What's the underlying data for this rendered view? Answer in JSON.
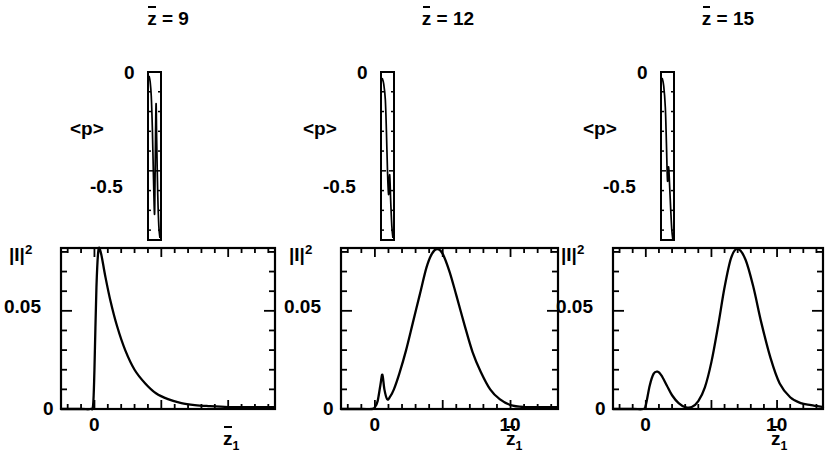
{
  "figure": {
    "type": "multi-panel scientific line plot",
    "n_columns": 3
  },
  "columns": [
    {
      "title": "z̅ = 9",
      "title_symbol": "z",
      "title_value": "9",
      "upper": {
        "ylabel": "<p>",
        "yticks": [
          "0",
          "-0.5"
        ],
        "ylim": [
          -0.85,
          0.0
        ],
        "xlim": [
          -0.6,
          0.6
        ]
      },
      "lower": {
        "ylabel": "|I|",
        "ylabel_exponent": "2",
        "yticks": [
          "0.05",
          "0"
        ],
        "xticks": [
          "0"
        ],
        "xlabel": "z̅1",
        "xlabel_base": "z",
        "xlabel_sub": "1",
        "ylim": [
          0,
          0.082
        ],
        "xlim": [
          -2.5,
          13.5
        ]
      }
    },
    {
      "title": "z̅ = 12",
      "title_symbol": "z",
      "title_value": "12",
      "upper": {
        "ylabel": "<p>",
        "yticks": [
          "0",
          "-0.5"
        ],
        "ylim": [
          -0.85,
          0.0
        ],
        "xlim": [
          -0.6,
          0.6
        ]
      },
      "lower": {
        "ylabel": "|I|",
        "ylabel_exponent": "2",
        "yticks": [
          "0.05",
          "0"
        ],
        "xticks": [
          "0",
          "10"
        ],
        "xlabel": "z̅1",
        "xlabel_base": "z",
        "xlabel_sub": "1",
        "ylim": [
          0,
          0.082
        ],
        "xlim": [
          -2.5,
          13.5
        ]
      }
    },
    {
      "title": "z̅ = 15",
      "title_symbol": "z",
      "title_value": "15",
      "upper": {
        "ylabel": "<p>",
        "yticks": [
          "0",
          "-0.5"
        ],
        "ylim": [
          -0.85,
          0.0
        ],
        "xlim": [
          -0.6,
          0.6
        ]
      },
      "lower": {
        "ylabel": "|I|",
        "ylabel_exponent": "2",
        "yticks": [
          "0.05",
          "0"
        ],
        "xticks": [
          "0",
          "10"
        ],
        "xlabel": "z̅1",
        "xlabel_base": "z",
        "xlabel_sub": "1",
        "ylim": [
          0,
          0.082
        ],
        "xlim": [
          -2.5,
          13.5
        ]
      }
    }
  ],
  "chart_data": [
    {
      "type": "line",
      "panel": "upper-1",
      "title": "z̅ = 9",
      "xlabel": "",
      "ylabel": "<p>",
      "xlim": [
        -0.6,
        0.6
      ],
      "ylim": [
        -0.85,
        0.0
      ],
      "yticks": [
        0,
        -0.5
      ],
      "grid": false,
      "legend": "none",
      "x": [
        -0.5,
        -0.4,
        -0.3,
        -0.2,
        -0.1,
        0.0,
        0.05,
        0.1,
        0.15,
        0.2,
        0.3,
        0.4,
        0.5
      ],
      "y": [
        -0.02,
        -0.05,
        -0.12,
        -0.28,
        -0.52,
        -0.72,
        -0.55,
        -0.3,
        -0.16,
        -0.34,
        -0.62,
        -0.78,
        -0.84
      ]
    },
    {
      "type": "line",
      "panel": "lower-1",
      "title": "",
      "xlabel": "z̅1",
      "ylabel": "|I|²",
      "xlim": [
        -2.5,
        13.5
      ],
      "ylim": [
        0,
        0.082
      ],
      "xticks": [
        0
      ],
      "yticks": [
        0,
        0.05
      ],
      "grid": false,
      "legend": "none",
      "x": [
        -2.5,
        -1.0,
        -0.3,
        -0.1,
        0.0,
        0.15,
        0.3,
        0.5,
        0.8,
        1.2,
        1.7,
        2.3,
        3.0,
        3.8,
        4.6,
        5.5,
        6.5,
        7.5,
        8.5,
        10.0,
        11.5,
        13.5
      ],
      "y": [
        0.0,
        0.0,
        0.0,
        0.002,
        0.02,
        0.062,
        0.081,
        0.079,
        0.068,
        0.055,
        0.042,
        0.03,
        0.02,
        0.013,
        0.008,
        0.005,
        0.003,
        0.002,
        0.0015,
        0.001,
        0.001,
        0.001
      ]
    },
    {
      "type": "line",
      "panel": "upper-2",
      "title": "z̅ = 12",
      "xlabel": "",
      "ylabel": "<p>",
      "xlim": [
        -0.6,
        0.6
      ],
      "ylim": [
        -0.85,
        0.0
      ],
      "yticks": [
        0,
        -0.5
      ],
      "grid": false,
      "legend": "none",
      "x": [
        -0.5,
        -0.35,
        -0.2,
        -0.1,
        0.0,
        0.1,
        0.2,
        0.3,
        0.4,
        0.5
      ],
      "y": [
        -0.03,
        -0.06,
        -0.14,
        -0.3,
        -0.5,
        -0.62,
        -0.52,
        -0.66,
        -0.78,
        -0.84
      ]
    },
    {
      "type": "line",
      "panel": "lower-2",
      "title": "",
      "xlabel": "z̅1",
      "ylabel": "|I|²",
      "xlim": [
        -2.5,
        13.5
      ],
      "ylim": [
        0,
        0.082
      ],
      "xticks": [
        0,
        10
      ],
      "yticks": [
        0,
        0.05
      ],
      "grid": false,
      "legend": "none",
      "x": [
        -2.5,
        -1.0,
        -0.2,
        0.0,
        0.2,
        0.4,
        0.55,
        0.7,
        0.9,
        1.1,
        1.4,
        1.8,
        2.3,
        2.8,
        3.3,
        3.8,
        4.2,
        4.6,
        5.0,
        5.5,
        6.0,
        6.6,
        7.2,
        7.8,
        8.5,
        9.2,
        10.0,
        11.0,
        12.0,
        13.5
      ],
      "y": [
        0.0,
        0.0,
        0.0,
        0.001,
        0.004,
        0.012,
        0.0175,
        0.01,
        0.005,
        0.006,
        0.01,
        0.018,
        0.03,
        0.044,
        0.058,
        0.072,
        0.079,
        0.0815,
        0.079,
        0.07,
        0.058,
        0.043,
        0.029,
        0.019,
        0.01,
        0.005,
        0.002,
        0.001,
        0.001,
        0.001
      ]
    },
    {
      "type": "line",
      "panel": "upper-3",
      "title": "z̅ = 15",
      "xlabel": "",
      "ylabel": "<p>",
      "xlim": [
        -0.6,
        0.6
      ],
      "ylim": [
        -0.85,
        0.0
      ],
      "yticks": [
        0,
        -0.5
      ],
      "grid": false,
      "legend": "none",
      "x": [
        -0.5,
        -0.35,
        -0.2,
        -0.1,
        0.0,
        0.1,
        0.2,
        0.3,
        0.4,
        0.5
      ],
      "y": [
        -0.03,
        -0.07,
        -0.18,
        -0.36,
        -0.55,
        -0.48,
        -0.58,
        -0.7,
        -0.8,
        -0.85
      ]
    },
    {
      "type": "line",
      "panel": "lower-3",
      "title": "",
      "xlabel": "z̅1",
      "ylabel": "|I|²",
      "xlim": [
        -2.5,
        13.5
      ],
      "ylim": [
        0,
        0.082
      ],
      "xticks": [
        0,
        10
      ],
      "yticks": [
        0,
        0.05
      ],
      "grid": false,
      "legend": "none",
      "x": [
        -2.5,
        -1.0,
        -0.2,
        0.0,
        0.3,
        0.6,
        0.9,
        1.2,
        1.6,
        2.0,
        2.5,
        3.0,
        3.5,
        4.0,
        4.5,
        5.0,
        5.5,
        6.0,
        6.5,
        7.0,
        7.6,
        8.2,
        8.8,
        9.5,
        10.2,
        11.0,
        11.8,
        12.6,
        13.5
      ],
      "y": [
        0.0,
        0.0,
        0.0,
        0.002,
        0.012,
        0.018,
        0.019,
        0.017,
        0.012,
        0.007,
        0.003,
        0.001,
        0.001,
        0.004,
        0.011,
        0.024,
        0.042,
        0.062,
        0.077,
        0.0815,
        0.076,
        0.062,
        0.044,
        0.026,
        0.013,
        0.006,
        0.003,
        0.002,
        0.001
      ]
    }
  ]
}
